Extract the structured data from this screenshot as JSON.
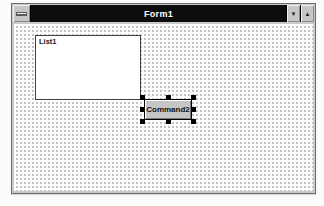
{
  "window": {
    "title": "Form1",
    "minimize_glyph": "▼",
    "maximize_glyph": "▲"
  },
  "form": {
    "listbox_label": "List1",
    "button_label": "Command2"
  },
  "colors": {
    "titlebar_bg": "#0d0d0d",
    "titlebar_text": "#ffffff",
    "window_frame": "#c9c9c9",
    "client_bg": "#fdfdfd",
    "grid_dot": "#bdbdbd",
    "control_bg": "#c6c6c6",
    "handle": "#000000"
  }
}
